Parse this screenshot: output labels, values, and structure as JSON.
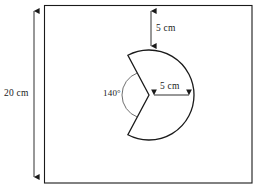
{
  "figure": {
    "shapes": {
      "rectangle": {
        "name": "rectangular-sheet",
        "x": 44,
        "y": 5,
        "width": 208,
        "height": 178,
        "stroke": "#1a1a1a",
        "fill": "#ffffff"
      },
      "sector": {
        "name": "major-sector",
        "center_x": 149,
        "center_y": 95,
        "radius": 45,
        "reflex_angle_deg": 220,
        "marked_angle_deg": 140,
        "stroke": "#1a1a1a",
        "fill": "#ffffff"
      }
    },
    "labels": {
      "height_dimension": "20 cm",
      "top_gap_dimension": "5 cm",
      "radius_dimension": "5 cm",
      "sector_angle": "140°"
    },
    "dimension_lines": {
      "height": {
        "name": "height-dimension-line",
        "x": 34,
        "y1": 8,
        "y2": 180
      },
      "top_gap": {
        "name": "top-gap-dimension-line",
        "x": 151,
        "y1": 6,
        "y2": 50
      },
      "radius": {
        "name": "radius-dimension-line",
        "y": 95,
        "x1": 150,
        "x2": 193
      }
    },
    "colors": {
      "stroke": "#1a1a1a",
      "background": "#ffffff",
      "angle_arc": "#555555"
    }
  }
}
